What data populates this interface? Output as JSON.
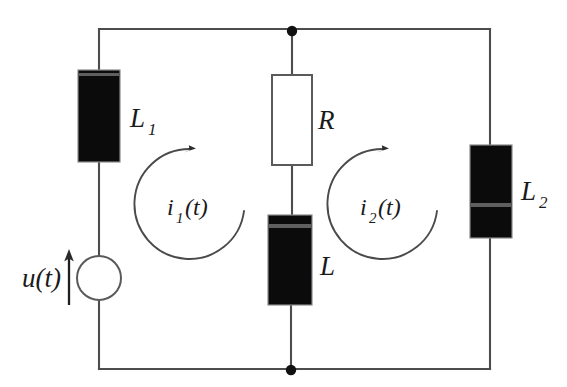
{
  "diagram": {
    "type": "electrical-circuit-schematic",
    "background_color": "#ffffff",
    "wire_color": "#4d4d4d",
    "filled_component_color": "#0b0b0b"
  },
  "components": {
    "source": {
      "label": "u(t)",
      "kind": "voltage-source",
      "symbol": "circle",
      "arrow_direction": "up",
      "cx": 99,
      "cy": 278,
      "r": 22,
      "label_x": 22,
      "label_y": 287
    },
    "inductor_l1": {
      "label": "L",
      "subscript": "1",
      "kind": "inductor",
      "symbol": "filled-rectangle",
      "x": 78,
      "y": 70,
      "w": 42,
      "h": 92,
      "label_x": 130,
      "label_y": 127
    },
    "resistor_r": {
      "label": "R",
      "subscript": "",
      "kind": "resistor",
      "symbol": "open-rectangle",
      "x": 272,
      "y": 75,
      "w": 40,
      "h": 90,
      "label_x": 318,
      "label_y": 129
    },
    "inductor_l": {
      "label": "L",
      "subscript": "",
      "kind": "inductor",
      "symbol": "filled-rectangle",
      "x": 268,
      "y": 215,
      "w": 44,
      "h": 90,
      "label_x": 320,
      "label_y": 275
    },
    "inductor_l2": {
      "label": "L",
      "subscript": "2",
      "kind": "inductor",
      "symbol": "filled-rectangle",
      "x": 470,
      "y": 145,
      "w": 42,
      "h": 93,
      "label_x": 521,
      "label_y": 200
    }
  },
  "mesh_currents": [
    {
      "name": "mesh-current-1",
      "label": "i",
      "subscript": "1",
      "suffix": "(t)",
      "direction": "clockwise",
      "cx": 193,
      "cy": 204,
      "r": 55,
      "label_x": 167,
      "label_y": 215
    },
    {
      "name": "mesh-current-2",
      "label": "i",
      "subscript": "2",
      "suffix": "(t)",
      "direction": "clockwise",
      "cx": 386,
      "cy": 204,
      "r": 55,
      "label_x": 360,
      "label_y": 215
    }
  ],
  "nodes": [
    {
      "name": "top-junction",
      "x": 292,
      "y": 31,
      "r": 5
    },
    {
      "name": "bottom-junction",
      "x": 291,
      "y": 370,
      "r": 5
    }
  ],
  "frame": {
    "left_x": 99,
    "right_x": 490,
    "top_y": 29,
    "bottom_y": 369
  }
}
